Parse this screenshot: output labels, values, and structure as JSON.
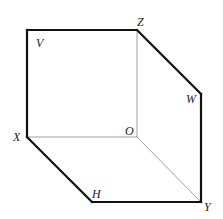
{
  "diagram": {
    "colors": {
      "background": "#ffffff",
      "bold_edge": "#111111",
      "thin_edge": "#888888",
      "label": "#222222"
    },
    "vertices": {
      "V": {
        "x": 27,
        "y": 30
      },
      "Z": {
        "x": 137,
        "y": 30
      },
      "W": {
        "x": 201,
        "y": 94
      },
      "Y": {
        "x": 201,
        "y": 202
      },
      "H": {
        "x": 92,
        "y": 202
      },
      "X": {
        "x": 27,
        "y": 137
      },
      "O": {
        "x": 137,
        "y": 137
      }
    },
    "labels": {
      "V": {
        "text": "V",
        "x": 36,
        "y": 47
      },
      "Z": {
        "text": "Z",
        "x": 137,
        "y": 26
      },
      "W": {
        "text": "W",
        "x": 186,
        "y": 103
      },
      "Y": {
        "text": "Y",
        "x": 204,
        "y": 211
      },
      "H": {
        "text": "H",
        "x": 92,
        "y": 198
      },
      "X": {
        "text": "X",
        "x": 13,
        "y": 141
      },
      "O": {
        "text": "O",
        "x": 125,
        "y": 135
      }
    },
    "bold_edges": [
      [
        "X",
        "V"
      ],
      [
        "V",
        "Z"
      ],
      [
        "Z",
        "W"
      ],
      [
        "W",
        "Y"
      ],
      [
        "Y",
        "H"
      ],
      [
        "H",
        "X"
      ]
    ],
    "thin_edges": [
      [
        "O",
        "X"
      ],
      [
        "O",
        "Z"
      ],
      [
        "O",
        "Y"
      ]
    ]
  }
}
